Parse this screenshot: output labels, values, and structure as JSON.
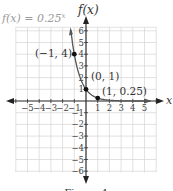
{
  "chart_data": {
    "type": "line",
    "function_label": "f(x) = 0.25",
    "function_exponent": "x",
    "xlabel": "x",
    "ylabel": "f(x)",
    "xlim": [
      -6,
      6
    ],
    "ylim": [
      -6,
      6
    ],
    "grid": true,
    "x_ticks": [
      -5,
      -4,
      -3,
      -2,
      -1,
      1,
      2,
      3,
      4,
      5
    ],
    "y_ticks": [
      6,
      5,
      4,
      3,
      2,
      1,
      -1,
      -2,
      -3,
      -4,
      -5,
      -6
    ],
    "series": [
      {
        "name": "f(x) = 0.25^x",
        "x": [
          -1.3,
          -1,
          -0.5,
          0,
          0.5,
          1,
          2,
          3,
          4
        ],
        "y": [
          6.06,
          4,
          2,
          1,
          0.5,
          0.25,
          0.0625,
          0.0156,
          0.0039
        ]
      }
    ],
    "points": [
      {
        "x": -1,
        "y": 4,
        "label": "(−1, 4)"
      },
      {
        "x": 0,
        "y": 1,
        "label": "(0, 1)"
      },
      {
        "x": 1,
        "y": 0.25,
        "label": "(1, 0.25)"
      }
    ]
  },
  "labels": {
    "function": "f(x) = 0.25",
    "exponent": "x",
    "y_axis": "f(x)",
    "x_axis": "x",
    "p1": "(−1, 4)",
    "p2": "(0, 1)",
    "p3": "(1, 0.25)",
    "xticks": [
      "−5",
      "−4",
      "−3",
      "−2",
      "−1",
      "1",
      "2",
      "3",
      "4",
      "5"
    ],
    "yticks": [
      "6",
      "5",
      "4",
      "3",
      "2",
      "1",
      "−1",
      "−2",
      "−3",
      "−4",
      "−5",
      "−6"
    ],
    "caption": "Figure 4"
  }
}
